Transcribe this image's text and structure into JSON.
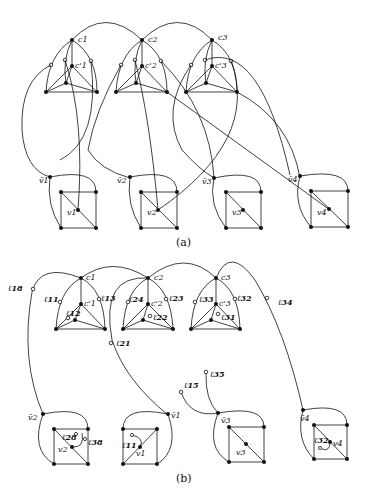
{
  "figure": {
    "panel_a": {
      "caption": "(a)",
      "clause_labels": [
        "c1",
        "c2",
        "c3"
      ],
      "clause_prime_labels": [
        "c'1",
        "c'2",
        "c'3"
      ],
      "variable_labels": [
        "v1",
        "v2",
        "v3",
        "v4"
      ],
      "negated_variable_labels": [
        "v̄1",
        "v̄2",
        "v̄3",
        "v̄4"
      ]
    },
    "panel_b": {
      "caption": "(b)",
      "clause_labels": [
        "c1",
        "c2",
        "c3"
      ],
      "clause_prime_labels": [
        "c'1",
        "c'2",
        "c'3"
      ],
      "variable_labels": [
        "v2",
        "v1",
        "v3",
        "v4"
      ],
      "negated_variable_labels": [
        "v̄2",
        "v̄1",
        "v̄3",
        "v̄4"
      ],
      "literal_labels": [
        "ℓ18",
        "ℓ11",
        "ℓ13",
        "ℓ12",
        "ℓ24",
        "ℓ23",
        "ℓ22",
        "ℓ21",
        "ℓ33",
        "ℓ32",
        "ℓ31",
        "ℓ34",
        "ℓ15",
        "ℓ35",
        "ℓ28",
        "ℓ38",
        "ℓ11",
        "ℓ32"
      ]
    }
  }
}
